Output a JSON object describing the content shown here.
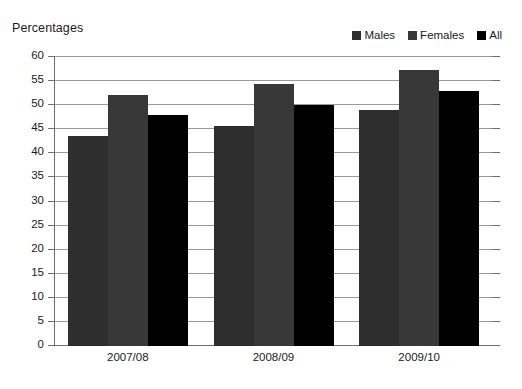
{
  "chart_data": {
    "type": "bar",
    "title": "Percentages",
    "xlabel": "",
    "ylabel": "",
    "ylim": [
      0,
      60
    ],
    "ytick_step": 5,
    "yticks": [
      0,
      5,
      10,
      15,
      20,
      25,
      30,
      35,
      40,
      45,
      50,
      55,
      60
    ],
    "grid": true,
    "legend_position": "top-right",
    "categories": [
      "2007/08",
      "2008/09",
      "2009/10"
    ],
    "series": [
      {
        "name": "Males",
        "color": "#2e2e2e",
        "values": [
          43.5,
          45.7,
          49.0
        ]
      },
      {
        "name": "Females",
        "color": "#383838",
        "values": [
          52.2,
          54.3,
          57.3
        ]
      },
      {
        "name": "All",
        "color": "#000000",
        "values": [
          48.0,
          50.0,
          53.0
        ]
      }
    ]
  }
}
